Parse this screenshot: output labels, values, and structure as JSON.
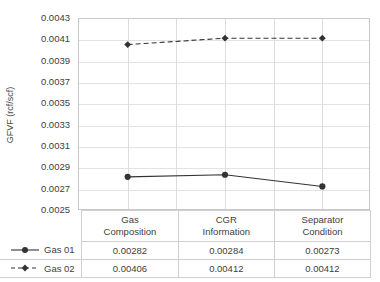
{
  "chart_data": {
    "type": "line",
    "title": "",
    "xlabel": "",
    "ylabel": "GFVF (rcf/scf)",
    "categories": [
      "Gas Composition",
      "CGR Information",
      "Separator Condition"
    ],
    "category_lines": [
      [
        "Gas",
        "Composition"
      ],
      [
        "CGR",
        "Information"
      ],
      [
        "Separator",
        "Condition"
      ]
    ],
    "series": [
      {
        "name": "Gas 01",
        "values": [
          0.00282,
          0.00284,
          0.00273
        ],
        "value_labels": [
          "0.00282",
          "0.00284",
          "0.00273"
        ],
        "line_style": "solid",
        "marker": "circle",
        "color": "#333333"
      },
      {
        "name": "Gas 02",
        "values": [
          0.00406,
          0.00412,
          0.00412
        ],
        "value_labels": [
          "0.00406",
          "0.00412",
          "0.00412"
        ],
        "line_style": "dashed",
        "marker": "diamond",
        "color": "#333333"
      }
    ],
    "ylim": [
      0.0025,
      0.0043
    ],
    "ytick_step": 0.0002,
    "ytick_labels": [
      "0.0043",
      "0.0041",
      "0.0039",
      "0.0037",
      "0.0035",
      "0.0033",
      "0.0031",
      "0.0029",
      "0.0027",
      "0.0025"
    ],
    "ytick_values": [
      0.0043,
      0.0041,
      0.0039,
      0.0037,
      0.0035,
      0.0033,
      0.0031,
      0.0029,
      0.0027,
      0.0025
    ],
    "grid": {
      "horizontal": true,
      "vertical": true
    },
    "legend_position": "table-left",
    "plot_background": "#ffffff",
    "grid_color": "#e3e3e3",
    "axis_color": "#c8c8c8"
  },
  "table": {
    "header_blank": "",
    "columns": [
      {
        "line1": "Gas",
        "line2": "Composition"
      },
      {
        "line1": "CGR",
        "line2": "Information"
      },
      {
        "line1": "Separator",
        "line2": "Condition"
      }
    ],
    "rows": [
      {
        "label": "Gas 01",
        "values": [
          "0.00282",
          "0.00284",
          "0.00273"
        ]
      },
      {
        "label": "Gas 02",
        "values": [
          "0.00406",
          "0.00412",
          "0.00412"
        ]
      }
    ]
  }
}
